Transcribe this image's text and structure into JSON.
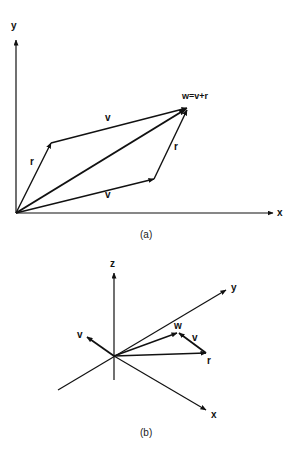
{
  "figure_a": {
    "caption": "(a)",
    "axes": {
      "x_label": "x",
      "y_label": "y"
    },
    "labels": {
      "w": "w=v+r",
      "v_top": "v",
      "v_bottom": "v",
      "r_left": "r",
      "r_right": "r"
    }
  },
  "figure_b": {
    "caption": "(b)",
    "axes": {
      "x_label": "x",
      "y_label": "y",
      "z_label": "z"
    },
    "labels": {
      "v_left": "v",
      "w": "w",
      "v_right": "v",
      "r": "r"
    }
  },
  "colors": {
    "stroke": "#111111",
    "background": "#ffffff"
  }
}
